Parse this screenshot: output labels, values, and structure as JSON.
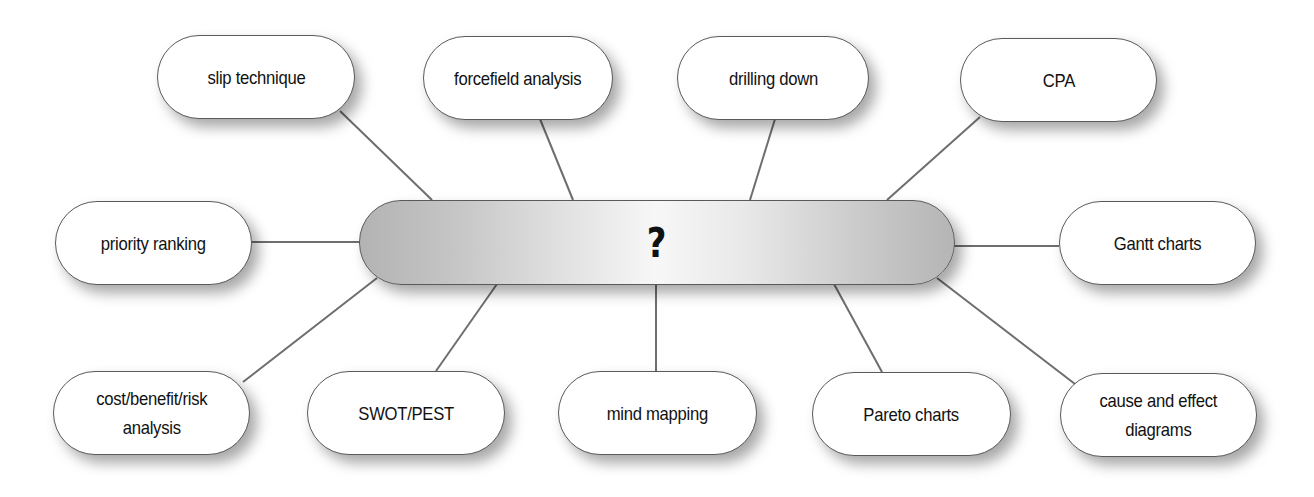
{
  "diagram": {
    "type": "mind-map",
    "center": {
      "label": "?",
      "x": 359,
      "y": 200,
      "w": 596,
      "h": 85
    },
    "nodes": [
      {
        "id": "slip-technique",
        "label": "slip technique",
        "x": 157,
        "y": 35,
        "w": 198,
        "h": 84
      },
      {
        "id": "forcefield-analysis",
        "label": "forcefield analysis",
        "x": 423,
        "y": 36,
        "w": 190,
        "h": 84
      },
      {
        "id": "drilling-down",
        "label": "drilling down",
        "x": 677,
        "y": 36,
        "w": 192,
        "h": 84
      },
      {
        "id": "cpa",
        "label": "CPA",
        "x": 960,
        "y": 38,
        "w": 197,
        "h": 84
      },
      {
        "id": "priority-ranking",
        "label": "priority ranking",
        "x": 55,
        "y": 201,
        "w": 197,
        "h": 84
      },
      {
        "id": "gantt-charts",
        "label": "Gantt charts",
        "x": 1059,
        "y": 201,
        "w": 197,
        "h": 84
      },
      {
        "id": "cost-benefit-risk-analysis",
        "label": "cost/benefit/risk\nanalysis",
        "x": 53,
        "y": 371,
        "w": 197,
        "h": 84
      },
      {
        "id": "swot-pest",
        "label": "SWOT/PEST",
        "x": 307,
        "y": 371,
        "w": 198,
        "h": 84
      },
      {
        "id": "mind-mapping",
        "label": "mind mapping",
        "x": 558,
        "y": 371,
        "w": 199,
        "h": 84
      },
      {
        "id": "pareto-charts",
        "label": "Pareto charts",
        "x": 812,
        "y": 372,
        "w": 199,
        "h": 84
      },
      {
        "id": "cause-and-effect-diagrams",
        "label": "cause and effect\ndiagrams",
        "x": 1060,
        "y": 373,
        "w": 197,
        "h": 84
      }
    ],
    "connectors": [
      {
        "from": "slip-technique",
        "x1": 340,
        "y1": 111,
        "x2": 432,
        "y2": 200
      },
      {
        "from": "forcefield-analysis",
        "x1": 540,
        "y1": 119,
        "x2": 573,
        "y2": 200
      },
      {
        "from": "drilling-down",
        "x1": 775,
        "y1": 119,
        "x2": 750,
        "y2": 200
      },
      {
        "from": "cpa",
        "x1": 980,
        "y1": 117,
        "x2": 887,
        "y2": 200
      },
      {
        "from": "priority-ranking",
        "x1": 252,
        "y1": 242,
        "x2": 360,
        "y2": 242
      },
      {
        "from": "gantt-charts",
        "x1": 953,
        "y1": 246,
        "x2": 1059,
        "y2": 246
      },
      {
        "from": "cost-benefit-risk-analysis",
        "x1": 243,
        "y1": 382,
        "x2": 377,
        "y2": 278
      },
      {
        "from": "swot-pest",
        "x1": 436,
        "y1": 371,
        "x2": 497,
        "y2": 284
      },
      {
        "from": "mind-mapping",
        "x1": 656,
        "y1": 371,
        "x2": 656,
        "y2": 284
      },
      {
        "from": "pareto-charts",
        "x1": 882,
        "y1": 372,
        "x2": 834,
        "y2": 284
      },
      {
        "from": "cause-and-effect-diagrams",
        "x1": 1075,
        "y1": 384,
        "x2": 937,
        "y2": 278
      }
    ],
    "colors": {
      "node_fill": "#ffffff",
      "node_border": "#5a5a5a",
      "connector": "#6e6e6e",
      "hub_edge": "#b3b3b3",
      "hub_center": "#f7f7f7",
      "text": "#111111"
    }
  }
}
